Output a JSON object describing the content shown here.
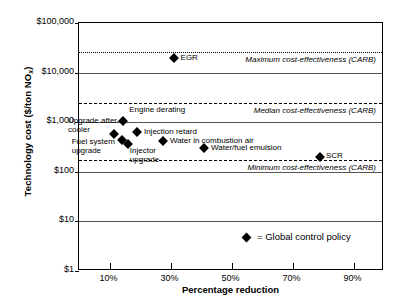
{
  "chart_data": {
    "type": "scatter",
    "title": "",
    "xlabel": "Percentage reduction",
    "ylabel": "Technology cost ($/ton NOx)",
    "ylabel_prefix": "Technology cost ($/ton NO",
    "ylabel_sub": "x",
    "ylabel_suffix": ")",
    "yscale": "log",
    "ylim": [
      1,
      100000
    ],
    "xlim": [
      0,
      100
    ],
    "grid": true,
    "legend_position": "inside-bottom",
    "ytick_labels": [
      "$100,000",
      "$10,000",
      "$1,000",
      "$100",
      "$10",
      "$1"
    ],
    "ytick_values": [
      100000,
      10000,
      1000,
      100,
      10,
      1
    ],
    "xtick_labels": [
      "10%",
      "30%",
      "50%",
      "70%",
      "90%"
    ],
    "xtick_values": [
      10,
      30,
      50,
      70,
      90
    ],
    "series_name": "Global control policy",
    "legend_text": "= Global control policy",
    "points": [
      {
        "label": "EGR",
        "x": 31,
        "y": 20000
      },
      {
        "label": "Engine derating",
        "x": 14.5,
        "y": 1050
      },
      {
        "label": "Injection retard",
        "x": 19,
        "y": 640
      },
      {
        "label": "Upgrade after-cooler",
        "x": 11.5,
        "y": 580
      },
      {
        "label": "Fuel system upgrade",
        "x": 14,
        "y": 440
      },
      {
        "label": "Injector upgrade",
        "x": 16,
        "y": 360
      },
      {
        "label": "Water in combustion air",
        "x": 27.5,
        "y": 410
      },
      {
        "label": "Water/fuel emulsion",
        "x": 41,
        "y": 300
      },
      {
        "label": "SCR",
        "x": 79,
        "y": 195
      }
    ],
    "reference_lines": [
      {
        "label": "Maximum cost-effectiveness (CARB)",
        "value": 26000,
        "style": "dotted"
      },
      {
        "label": "Median cost-effectiveness (CARB)",
        "value": 2400,
        "style": "dashed"
      },
      {
        "label": "Minimum cost-effectiveness (CARB)",
        "value": 170,
        "style": "dashed"
      }
    ]
  }
}
